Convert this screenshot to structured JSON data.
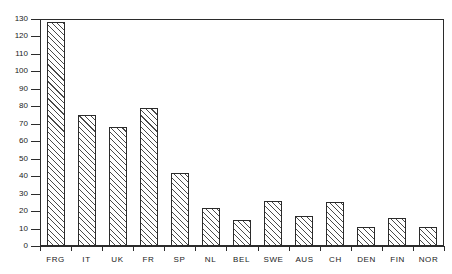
{
  "chart_data": {
    "type": "bar",
    "title": "",
    "subtitle": "",
    "xlabel": "",
    "ylabel": "",
    "categories": [
      "FRG",
      "IT",
      "UK",
      "FR",
      "SP",
      "NL",
      "BEL",
      "SWE",
      "AUS",
      "CH",
      "DEN",
      "FIN",
      "NOR"
    ],
    "values": [
      128,
      75,
      68,
      79,
      42,
      22,
      15,
      26,
      17,
      25,
      11,
      16,
      11
    ],
    "series": [
      {
        "name": "",
        "values": [
          128,
          75,
          68,
          79,
          42,
          22,
          15,
          26,
          17,
          25,
          11,
          16,
          11
        ]
      }
    ],
    "ylim": [
      0,
      130
    ],
    "ytick_values": [
      0,
      10,
      20,
      30,
      40,
      50,
      60,
      70,
      80,
      90,
      100,
      110,
      120,
      130
    ],
    "ytick_labels": [
      "0",
      "10",
      "20",
      "30",
      "40",
      "50",
      "60",
      "70",
      "80",
      "90",
      "100",
      "110",
      "120",
      "130"
    ],
    "grid": false,
    "legend": null,
    "legend_position": "none",
    "bar_fill": "hatched-diagonal",
    "bar_edge_color": "#2b2b2b",
    "background_color": "#ffffff",
    "annotations": []
  },
  "axes": {
    "y_axis_name": "y-axis",
    "x_axis_name": "x-axis"
  }
}
